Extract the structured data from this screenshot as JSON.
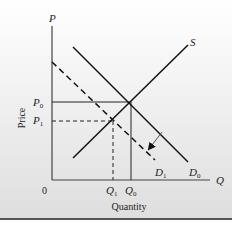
{
  "diagram": {
    "type": "supply-demand",
    "axes": {
      "y_axis_label": "P",
      "x_axis_label": "Q",
      "y_title": "Price",
      "x_title": "Quantity",
      "origin_label": "0"
    },
    "curves": {
      "supply": {
        "label": "S",
        "style": "solid"
      },
      "demand_initial": {
        "label": "D",
        "subscript": "0",
        "style": "solid"
      },
      "demand_shifted": {
        "label": "D",
        "subscript": "1",
        "style": "dashed"
      }
    },
    "price_levels": [
      {
        "label": "P",
        "subscript": "0",
        "style": "solid"
      },
      {
        "label": "P",
        "subscript": "1",
        "style": "dashed"
      }
    ],
    "quantity_levels": [
      {
        "label": "Q",
        "subscript": "1",
        "style": "dashed"
      },
      {
        "label": "Q",
        "subscript": "0",
        "style": "solid"
      }
    ],
    "annotation": {
      "arrow": "shift from D0 to D1 (demand decrease)"
    }
  },
  "colors": {
    "line": "#111111",
    "text": "#222222",
    "arrow": "#555555"
  }
}
